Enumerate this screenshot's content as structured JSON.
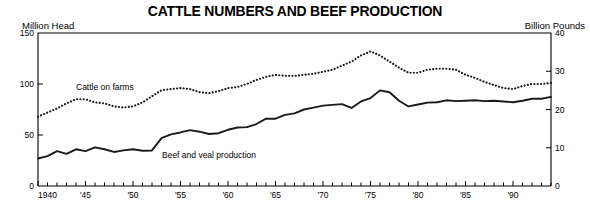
{
  "title": "CATTLE NUMBERS AND BEEF PRODUCTION",
  "axis_labels": {
    "left": "Million Head",
    "right": "Billion Pounds"
  },
  "series_labels": {
    "cattle": "Cattle on farms",
    "beef": "Beef and veal production"
  },
  "colors": {
    "line": "#1a1a1a",
    "frame": "#000000",
    "background": "#ffffff"
  },
  "chart_data": {
    "type": "line",
    "title": "CATTLE NUMBERS AND BEEF PRODUCTION",
    "xlabel": "",
    "ylabel": "Million Head",
    "y2label": "Billion Pounds",
    "xlim": [
      1940,
      1994
    ],
    "ylim": [
      0,
      150
    ],
    "y2lim": [
      0,
      40
    ],
    "yticks": [
      0,
      50,
      100,
      150
    ],
    "y2ticks": [
      0,
      10,
      20,
      30,
      40
    ],
    "xticks": [
      1940,
      1941,
      1942,
      1943,
      1944,
      1945,
      1946,
      1947,
      1948,
      1949,
      1950,
      1951,
      1952,
      1953,
      1954,
      1955,
      1956,
      1957,
      1958,
      1959,
      1960,
      1961,
      1962,
      1963,
      1964,
      1965,
      1966,
      1967,
      1968,
      1969,
      1970,
      1971,
      1972,
      1973,
      1974,
      1975,
      1976,
      1977,
      1978,
      1979,
      1980,
      1981,
      1982,
      1983,
      1984,
      1985,
      1986,
      1987,
      1988,
      1989,
      1990,
      1991,
      1992,
      1993,
      1994
    ],
    "xticklabels": [
      {
        "x": 1940,
        "label": "1940"
      },
      {
        "x": 1945,
        "label": "'45"
      },
      {
        "x": 1950,
        "label": "'50"
      },
      {
        "x": 1955,
        "label": "'55"
      },
      {
        "x": 1960,
        "label": "'60"
      },
      {
        "x": 1965,
        "label": "'65"
      },
      {
        "x": 1970,
        "label": "'70"
      },
      {
        "x": 1975,
        "label": "'75"
      },
      {
        "x": 1980,
        "label": "'80"
      },
      {
        "x": 1985,
        "label": "'85"
      },
      {
        "x": 1990,
        "label": "'90"
      }
    ],
    "grid": false,
    "legend": "inline-annotations",
    "series": [
      {
        "name": "Cattle on farms",
        "axis": "left",
        "unit": "million head",
        "style": "dotted",
        "x": [
          1940,
          1941,
          1942,
          1943,
          1944,
          1945,
          1946,
          1947,
          1948,
          1949,
          1950,
          1951,
          1952,
          1953,
          1954,
          1955,
          1956,
          1957,
          1958,
          1959,
          1960,
          1961,
          1962,
          1963,
          1964,
          1965,
          1966,
          1967,
          1968,
          1969,
          1970,
          1971,
          1972,
          1973,
          1974,
          1975,
          1976,
          1977,
          1978,
          1979,
          1980,
          1981,
          1982,
          1983,
          1984,
          1985,
          1986,
          1987,
          1988,
          1989,
          1990,
          1991,
          1992,
          1993,
          1994
        ],
        "values": [
          68,
          72,
          76,
          81,
          85,
          85,
          82,
          81,
          78,
          77,
          78,
          82,
          88,
          94,
          95,
          96,
          95,
          92,
          91,
          93,
          96,
          97,
          100,
          104,
          107,
          109,
          108,
          108,
          109,
          110,
          112,
          114,
          118,
          122,
          128,
          132,
          128,
          122,
          116,
          111,
          111,
          114,
          115,
          115,
          114,
          109,
          106,
          102,
          99,
          96,
          95,
          98,
          100,
          100,
          101
        ]
      },
      {
        "name": "Beef and veal production",
        "axis": "right",
        "unit": "billion pounds",
        "style": "solid",
        "x": [
          1940,
          1941,
          1942,
          1943,
          1944,
          1945,
          1946,
          1947,
          1948,
          1949,
          1950,
          1951,
          1952,
          1953,
          1954,
          1955,
          1956,
          1957,
          1958,
          1959,
          1960,
          1961,
          1962,
          1963,
          1964,
          1965,
          1966,
          1967,
          1968,
          1969,
          1970,
          1971,
          1972,
          1973,
          1974,
          1975,
          1976,
          1977,
          1978,
          1979,
          1980,
          1981,
          1982,
          1983,
          1984,
          1985,
          1986,
          1987,
          1988,
          1989,
          1990,
          1991,
          1992,
          1993,
          1994
        ],
        "values": [
          7.2,
          7.8,
          9.1,
          8.4,
          9.6,
          9.1,
          10.1,
          9.6,
          8.9,
          9.3,
          9.6,
          9.2,
          9.3,
          12.5,
          13.5,
          14.0,
          14.6,
          14.2,
          13.6,
          13.8,
          14.7,
          15.3,
          15.4,
          16.2,
          17.6,
          17.6,
          18.6,
          19.0,
          20.0,
          20.5,
          21.0,
          21.2,
          21.4,
          20.4,
          22.1,
          23.0,
          25.0,
          24.5,
          22.3,
          20.8,
          21.3,
          21.8,
          21.9,
          22.4,
          22.2,
          22.3,
          22.4,
          22.2,
          22.3,
          22.1,
          21.9,
          22.3,
          22.8,
          22.8,
          23.3
        ]
      }
    ]
  }
}
